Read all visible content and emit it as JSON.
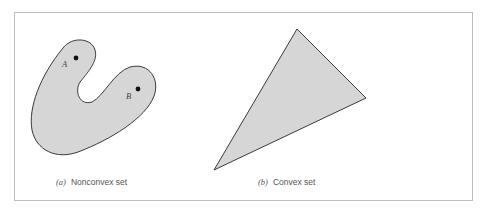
{
  "figure": {
    "panels": [
      {
        "id": "a",
        "tag": "(a)",
        "caption": "Nonconvex set",
        "shape": "nonconvex-blob",
        "points": [
          {
            "label": "A"
          },
          {
            "label": "B"
          }
        ]
      },
      {
        "id": "b",
        "tag": "(b)",
        "caption": "Convex set",
        "shape": "triangle"
      }
    ],
    "colors": {
      "fill": "#d6d6d6",
      "stroke": "#3a3a3a",
      "frame": "#bdbdbd",
      "text": "#555555"
    }
  }
}
